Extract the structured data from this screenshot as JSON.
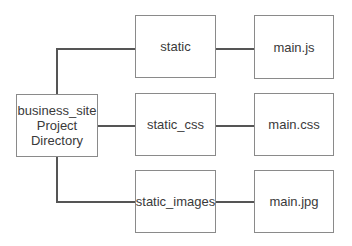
{
  "diagram": {
    "root": {
      "label_lines": [
        "business_site",
        "Project",
        "Directory"
      ]
    },
    "folders": [
      {
        "label": "static",
        "file": "main.js"
      },
      {
        "label": "static_css",
        "file": "main.css"
      },
      {
        "label": "static_images",
        "file": "main.jpg"
      }
    ]
  }
}
